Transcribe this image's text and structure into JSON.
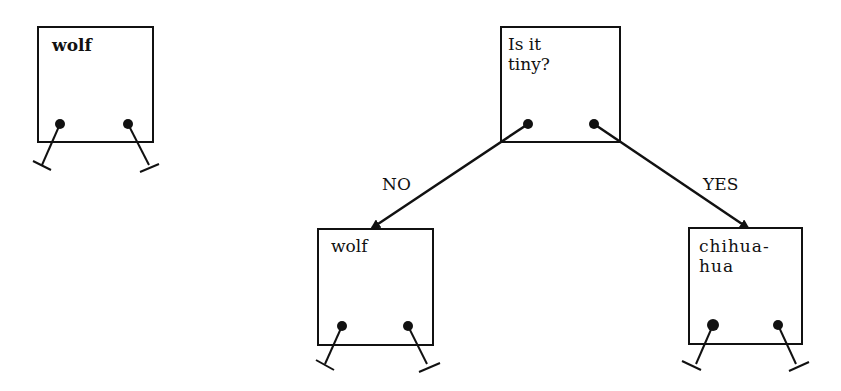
{
  "nodes": {
    "standalone": {
      "label": "wolf"
    },
    "root": {
      "label": "Is it\ntiny?"
    },
    "no_child": {
      "label": "wolf"
    },
    "yes_child": {
      "label": "chihua-\nhua"
    }
  },
  "edges": {
    "no": {
      "label": "NO"
    },
    "yes": {
      "label": "YES"
    }
  }
}
